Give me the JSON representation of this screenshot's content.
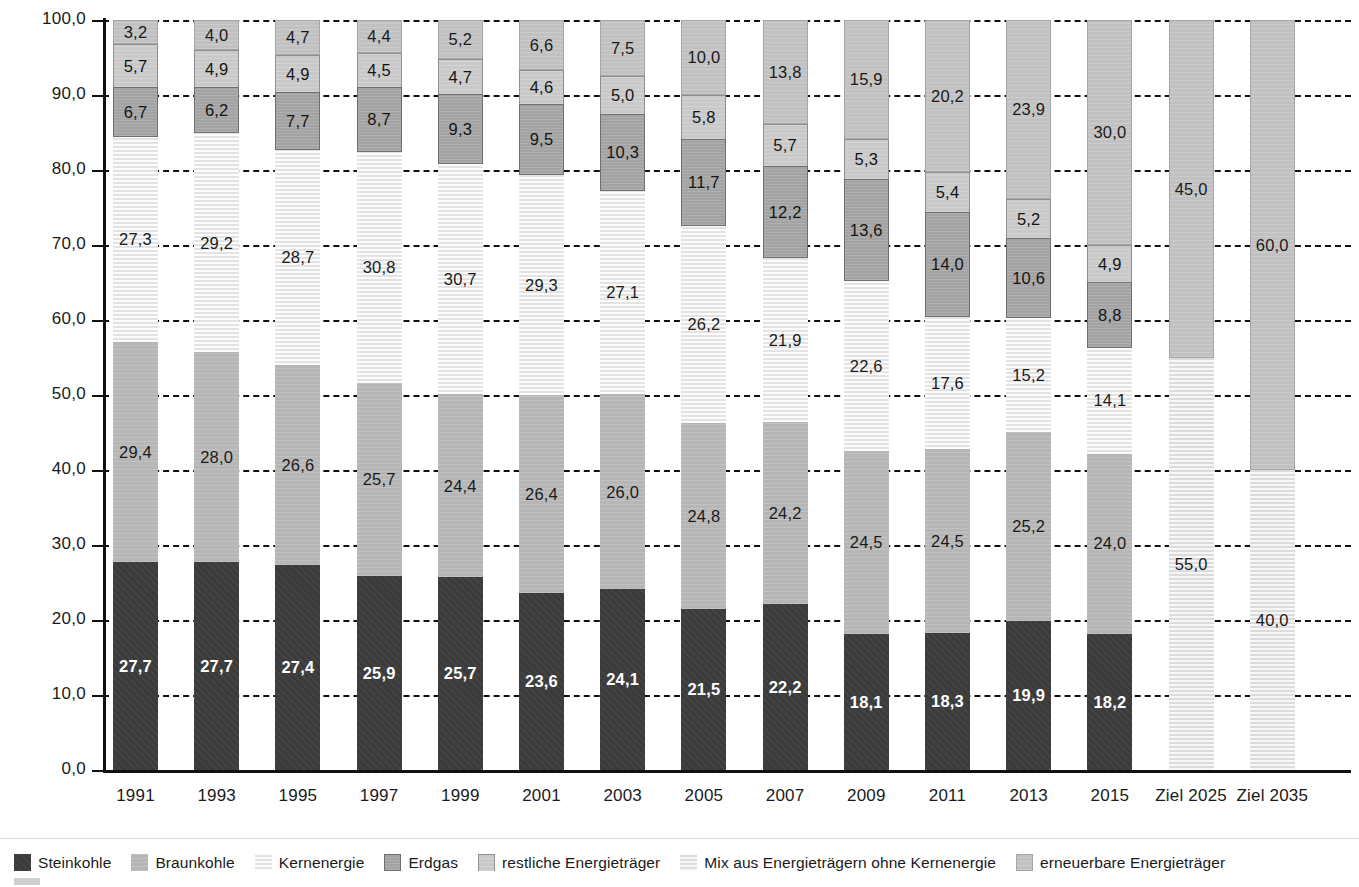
{
  "chart_data": {
    "type": "bar",
    "subtype": "stacked-bar-100",
    "title": "",
    "xlabel": "",
    "ylabel": "",
    "ylim": [
      0,
      100
    ],
    "grid": true,
    "legend_position": "bottom",
    "y_ticks": [
      "0,0",
      "10,0",
      "20,0",
      "30,0",
      "40,0",
      "50,0",
      "60,0",
      "70,0",
      "80,0",
      "90,0",
      "100,0"
    ],
    "categories": [
      "1991",
      "1993",
      "1995",
      "1997",
      "1999",
      "2001",
      "2003",
      "2005",
      "2007",
      "2009",
      "2011",
      "2013",
      "2015",
      "Ziel 2025",
      "Ziel 2035"
    ],
    "series": [
      {
        "name": "Steinkohle",
        "color": "#3b3b3b",
        "values": [
          27.7,
          27.7,
          27.4,
          25.9,
          25.7,
          23.6,
          24.1,
          21.5,
          22.2,
          18.1,
          18.3,
          19.9,
          18.2,
          null,
          null
        ],
        "labels": [
          "27,7",
          "27,7",
          "27,4",
          "25,9",
          "25,7",
          "23,6",
          "24,1",
          "21,5",
          "22,2",
          "18,1",
          "18,3",
          "19,9",
          "18,2",
          "",
          ""
        ]
      },
      {
        "name": "Braunkohle",
        "color": "#b6b6b6",
        "values": [
          29.4,
          28.0,
          26.6,
          25.7,
          24.4,
          26.4,
          26.0,
          24.8,
          24.2,
          24.5,
          24.5,
          25.2,
          24.0,
          null,
          null
        ],
        "labels": [
          "29,4",
          "28,0",
          "26,6",
          "25,7",
          "24,4",
          "26,4",
          "26,0",
          "24,8",
          "24,2",
          "24,5",
          "24,5",
          "25,2",
          "24,0",
          "",
          ""
        ]
      },
      {
        "name": "Kernenergie",
        "color": "#ebebeb",
        "values": [
          27.3,
          29.2,
          28.7,
          30.8,
          30.7,
          29.3,
          27.1,
          26.2,
          21.9,
          22.6,
          17.6,
          15.2,
          14.1,
          null,
          null
        ],
        "labels": [
          "27,3",
          "29,2",
          "28,7",
          "30,8",
          "30,7",
          "29,3",
          "27,1",
          "26,2",
          "21,9",
          "22,6",
          "17,6",
          "15,2",
          "14,1",
          "",
          ""
        ]
      },
      {
        "name": "Erdgas",
        "color": "#a3a3a3",
        "values": [
          6.7,
          6.2,
          7.7,
          8.7,
          9.3,
          9.5,
          10.3,
          11.7,
          12.2,
          13.6,
          14.0,
          10.6,
          8.8,
          null,
          null
        ],
        "labels": [
          "6,7",
          "6,2",
          "7,7",
          "8,7",
          "9,3",
          "9,5",
          "10,3",
          "11,7",
          "12,2",
          "13,6",
          "14,0",
          "10,6",
          "8,8",
          "",
          ""
        ]
      },
      {
        "name": "restliche Energieträger",
        "color": "#c9c9c9",
        "values": [
          5.7,
          4.9,
          4.9,
          4.5,
          4.7,
          4.6,
          5.0,
          5.8,
          5.7,
          5.3,
          5.4,
          5.2,
          4.9,
          null,
          null
        ],
        "labels": [
          "5,7",
          "4,9",
          "4,9",
          "4,5",
          "4,7",
          "4,6",
          "5,0",
          "5,8",
          "5,7",
          "5,3",
          "5,4",
          "5,2",
          "4,9",
          "",
          ""
        ]
      },
      {
        "name": "Mix aus Energieträgern ohne Kernenergie",
        "color": "#e3e3e3",
        "values": [
          null,
          null,
          null,
          null,
          null,
          null,
          null,
          null,
          null,
          null,
          null,
          null,
          null,
          55.0,
          40.0
        ],
        "labels": [
          "",
          "",
          "",
          "",
          "",
          "",
          "",
          "",
          "",
          "",
          "",
          "",
          "",
          "55,0",
          "40,0"
        ]
      },
      {
        "name": "erneuerbare Energieträger",
        "color": "#c1c1c1",
        "values": [
          3.2,
          4.0,
          4.7,
          4.4,
          5.2,
          6.6,
          7.5,
          10.0,
          13.8,
          15.9,
          20.2,
          23.9,
          30.0,
          45.0,
          60.0
        ],
        "labels": [
          "3,2",
          "4,0",
          "4,7",
          "4,4",
          "5,2",
          "6,6",
          "7,5",
          "10,0",
          "13,8",
          "15,9",
          "20,2",
          "23,9",
          "30,0",
          "45,0",
          "60,0"
        ]
      }
    ]
  },
  "legend": {
    "items": [
      {
        "label": "Steinkohle",
        "swatch": "s-steinkohle",
        "color": "#3b3b3b"
      },
      {
        "label": "Braunkohle",
        "swatch": "s-braunkohle",
        "color": "#b6b6b6"
      },
      {
        "label": "Kernenergie",
        "swatch": "s-kernenergie",
        "color": "#ebebeb"
      },
      {
        "label": "Erdgas",
        "swatch": "s-erdgas",
        "color": "#a3a3a3"
      },
      {
        "label": "restliche Energieträger",
        "swatch": "s-restliche",
        "color": "#c9c9c9"
      },
      {
        "label": "Mix aus Energieträgern ohne Kernenergie",
        "swatch": "s-mix",
        "color": "#e3e3e3"
      },
      {
        "label": "erneuerbare Energieträger",
        "swatch": "s-erneuerbare",
        "color": "#c1c1c1"
      }
    ]
  }
}
